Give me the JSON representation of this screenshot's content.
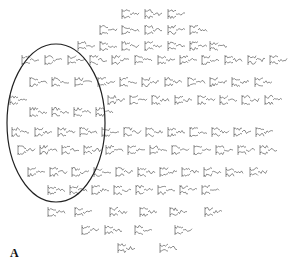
{
  "figure": {
    "panel_label": "A",
    "background": "#ffffff",
    "stroke_color": "#333333",
    "highlight": {
      "shape": "ellipse",
      "cx": 56,
      "cy": 123,
      "rx": 49,
      "ry": 79,
      "stroke": "#222222"
    }
  },
  "chart_data": {
    "type": "sensor-waveform-topography",
    "title": "",
    "panel": "A",
    "highlight_region": {
      "shape": "ellipse",
      "cx": 56,
      "cy": 123,
      "rx": 49,
      "ry": 79
    },
    "rows": [
      {
        "y": 14,
        "x": [
          122,
          145,
          168
        ]
      },
      {
        "y": 30,
        "x": [
          100,
          122,
          145,
          168,
          190
        ]
      },
      {
        "y": 46,
        "x": [
          78,
          100,
          122,
          145,
          168,
          190,
          210
        ]
      },
      {
        "y": 60,
        "x": [
          22,
          45,
          68,
          90,
          112,
          135,
          158,
          180,
          202,
          225,
          248,
          270
        ]
      },
      {
        "y": 82,
        "x": [
          30,
          52,
          75,
          98,
          120,
          142,
          165,
          188,
          210,
          232,
          255
        ]
      },
      {
        "y": 100,
        "x": [
          10,
          108,
          130,
          152,
          175,
          198,
          220,
          242,
          265
        ]
      },
      {
        "y": 112,
        "x": [
          30,
          52,
          74,
          96
        ]
      },
      {
        "y": 132,
        "x": [
          12,
          35,
          58,
          80,
          102,
          124,
          146,
          168,
          190,
          212,
          234,
          256
        ]
      },
      {
        "y": 150,
        "x": [
          18,
          40,
          62,
          84,
          106,
          128,
          150,
          172,
          194,
          216,
          238,
          260
        ]
      },
      {
        "y": 172,
        "x": [
          28,
          50,
          72,
          94,
          116,
          138,
          160,
          182,
          204,
          226,
          250
        ]
      },
      {
        "y": 190,
        "x": [
          48,
          70,
          92,
          114,
          136,
          158,
          180,
          202
        ]
      },
      {
        "y": 212,
        "x": [
          48,
          75,
          110,
          140,
          170,
          205
        ]
      },
      {
        "y": 230,
        "x": [
          82,
          105,
          135,
          175
        ]
      },
      {
        "y": 248,
        "x": [
          118,
          160
        ]
      }
    ]
  }
}
